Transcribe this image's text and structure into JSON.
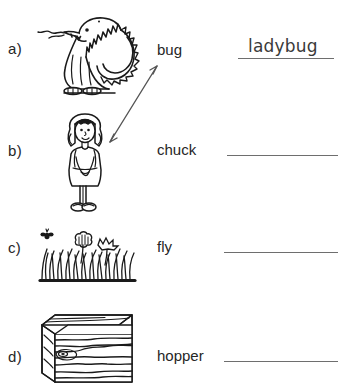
{
  "worksheet": {
    "type": "compound-word-matching",
    "background_color": "#ffffff",
    "ink_color": "#262626",
    "line_color": "#6e6e6e"
  },
  "rows": [
    {
      "letter": "a)",
      "picture_name": "dragon-illustration",
      "word": "bug",
      "answer": "ladybug",
      "answer_filled": true
    },
    {
      "letter": "b)",
      "picture_name": "girl-illustration",
      "word": "chuck",
      "answer": "",
      "answer_filled": false
    },
    {
      "letter": "c)",
      "picture_name": "grass-illustration",
      "word": "fly",
      "answer": "",
      "answer_filled": false
    },
    {
      "letter": "d)",
      "picture_name": "wood-block-illustration",
      "word": "hopper",
      "answer": "",
      "answer_filled": false
    }
  ],
  "annotation": {
    "name": "double-headed-arrow",
    "description": "hand-drawn double-headed arrow linking the dragon picture and the girl picture"
  }
}
